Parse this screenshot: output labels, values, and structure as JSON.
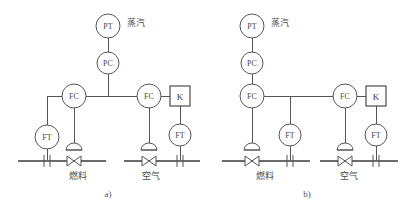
{
  "figure": {
    "title": "",
    "background_color": "#ffffff",
    "line_color": "#555555",
    "text_color": "#4a4a4a",
    "width": 408,
    "height": 210
  },
  "panels": [
    {
      "id": "panel-a",
      "caption": "a)",
      "stream_labels": {
        "top": "蒸汽",
        "left_bottom": "燃料",
        "right_bottom": "空气"
      },
      "instruments": [
        {
          "id": "a-pt",
          "tag": "PT",
          "shape": "circle",
          "name": "pressure-transmitter"
        },
        {
          "id": "a-pc",
          "tag": "PC",
          "shape": "circle",
          "name": "pressure-controller"
        },
        {
          "id": "a-fc-fuel",
          "tag": "FC",
          "shape": "circle",
          "name": "fuel-flow-controller"
        },
        {
          "id": "a-ft-fuel",
          "tag": "FT",
          "shape": "circle",
          "name": "fuel-flow-transmitter"
        },
        {
          "id": "a-fc-air",
          "tag": "FC",
          "shape": "circle",
          "name": "air-flow-controller"
        },
        {
          "id": "a-k",
          "tag": "K",
          "shape": "square",
          "name": "ratio-multiplier"
        },
        {
          "id": "a-ft-air",
          "tag": "FT",
          "shape": "circle",
          "name": "air-flow-transmitter"
        }
      ],
      "final_elements": [
        {
          "id": "a-valve-fuel",
          "name": "fuel-control-valve",
          "symbol": "control-valve"
        },
        {
          "id": "a-valve-air",
          "name": "air-control-valve",
          "symbol": "control-valve"
        },
        {
          "id": "a-orifice-fuel",
          "name": "fuel-orifice-plate",
          "symbol": "orifice-plate"
        },
        {
          "id": "a-orifice-air",
          "name": "air-orifice-plate",
          "symbol": "orifice-plate"
        }
      ]
    },
    {
      "id": "panel-b",
      "caption": "b)",
      "stream_labels": {
        "top": "蒸汽",
        "left_bottom": "燃料",
        "right_bottom": "空气"
      },
      "instruments": [
        {
          "id": "b-pt",
          "tag": "PT",
          "shape": "circle",
          "name": "pressure-transmitter"
        },
        {
          "id": "b-pc",
          "tag": "PC",
          "shape": "circle",
          "name": "pressure-controller"
        },
        {
          "id": "b-fc-fuel",
          "tag": "FC",
          "shape": "circle",
          "name": "fuel-flow-controller"
        },
        {
          "id": "b-ft-fuel",
          "tag": "FT",
          "shape": "circle",
          "name": "fuel-flow-transmitter"
        },
        {
          "id": "b-fc-air",
          "tag": "FC",
          "shape": "circle",
          "name": "air-flow-controller"
        },
        {
          "id": "b-k",
          "tag": "K",
          "shape": "square",
          "name": "ratio-multiplier"
        },
        {
          "id": "b-ft-air",
          "tag": "FT",
          "shape": "circle",
          "name": "air-flow-transmitter"
        }
      ],
      "final_elements": [
        {
          "id": "b-valve-fuel",
          "name": "fuel-control-valve",
          "symbol": "control-valve"
        },
        {
          "id": "b-valve-air",
          "name": "air-control-valve",
          "symbol": "control-valve"
        },
        {
          "id": "b-orifice-fuel",
          "name": "fuel-orifice-plate",
          "symbol": "orifice-plate"
        },
        {
          "id": "b-orifice-air",
          "name": "air-orifice-plate",
          "symbol": "orifice-plate"
        }
      ]
    }
  ],
  "tags": {
    "pt": "PT",
    "pc": "PC",
    "fc": "FC",
    "ft": "FT",
    "k": "K"
  },
  "labels": {
    "steam": "蒸汽",
    "fuel": "燃料",
    "air": "空气",
    "caption_a": "a)",
    "caption_b": "b)"
  }
}
